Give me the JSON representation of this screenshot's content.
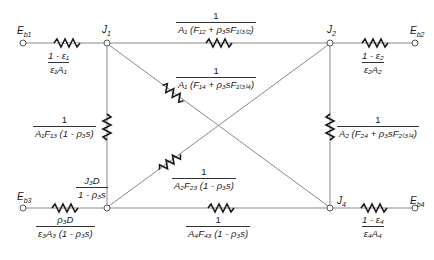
{
  "nodes": {
    "Eb1": {
      "label": "E",
      "sub": "b1"
    },
    "Eb2": {
      "label": "E",
      "sub": "b2"
    },
    "Eb3": {
      "label": "E",
      "sub": "b3"
    },
    "Eb4": {
      "label": "E",
      "sub": "b4"
    },
    "J1": {
      "label": "J",
      "sub": "1"
    },
    "J2": {
      "label": "J",
      "sub": "2"
    },
    "J4": {
      "label": "J",
      "sub": "4"
    }
  },
  "resistances": {
    "surface_1": {
      "num": "1 - ε₁",
      "den": "ε₁A₁"
    },
    "surface_2": {
      "num": "1 - ε₂",
      "den": "ε₂A₂"
    },
    "surface_3": {
      "num": "ρ₃D",
      "den": "ε₃A₃ (1 - ρ₃s)"
    },
    "surface_4": {
      "num": "1 - ε₄",
      "den": "ε₄A₄"
    },
    "space_12": {
      "num": "1",
      "den": "A₁ (F₁₂ + ρ₃sF₁₍₃₎₂)"
    },
    "space_14": {
      "num": "1",
      "den": "A₁ (F₁₄ + ρ₃sF₁₍₃₎₄)"
    },
    "space_13": {
      "num": "1",
      "den": "A₁F₁₃ (1 - ρ₃s)"
    },
    "space_24": {
      "num": "1",
      "den": "A₂ (F₂₄ + ρ₃sF₂₍₃₎₄)"
    },
    "space_23": {
      "num": "1",
      "den": "A₂F₂₃ (1 - ρ₃s)"
    },
    "space_43": {
      "num": "1",
      "den": "A₄F₄₃ (1 - ρ₃s)"
    }
  },
  "node_3_radiosity": {
    "num": "J₃D",
    "den": "1 - ρ₃s"
  }
}
